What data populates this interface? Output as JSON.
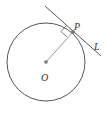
{
  "diagram": {
    "type": "circle-tangent",
    "labels": {
      "center": "O",
      "point": "P",
      "line": "L"
    },
    "colors": {
      "stroke": "#555555",
      "radius": "#999999",
      "point": "#777777"
    }
  }
}
